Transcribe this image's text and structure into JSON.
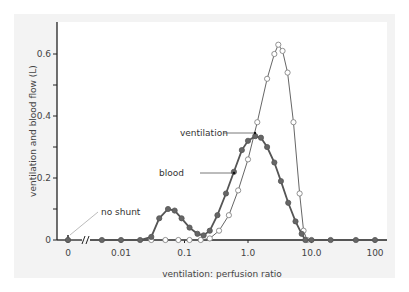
{
  "chart_data": {
    "type": "line",
    "title": "",
    "xlabel": "ventilation: perfusion ratio",
    "ylabel": "ventilation and blood flow (L)",
    "x_scale": "log",
    "x_ticks": [
      "0",
      "0.01",
      "0.1",
      "1.0",
      "10.0",
      "100"
    ],
    "y_ticks": [
      "0",
      "0.2",
      "0.4",
      "0.6"
    ],
    "ylim": [
      0,
      0.7
    ],
    "grid": false,
    "legend": "none (inline annotations)",
    "series": [
      {
        "name": "blood",
        "marker": "filled circle",
        "x": [
          0.005,
          0.01,
          0.02,
          0.03,
          0.04,
          0.055,
          0.07,
          0.09,
          0.12,
          0.16,
          0.2,
          0.25,
          0.33,
          0.45,
          0.6,
          0.8,
          1.0,
          1.3,
          1.6,
          2.0,
          2.6,
          3.3,
          4.3,
          5.6,
          7.0,
          8.0,
          10,
          20,
          50,
          100
        ],
        "values": [
          0,
          0,
          0,
          0.01,
          0.07,
          0.1,
          0.095,
          0.07,
          0.04,
          0.02,
          0.015,
          0.03,
          0.08,
          0.15,
          0.22,
          0.29,
          0.32,
          0.335,
          0.33,
          0.3,
          0.25,
          0.19,
          0.12,
          0.06,
          0.02,
          0.0,
          0,
          0,
          0,
          0
        ]
      },
      {
        "name": "ventilation",
        "marker": "open circle",
        "x": [
          0.03,
          0.05,
          0.08,
          0.12,
          0.18,
          0.25,
          0.35,
          0.5,
          0.7,
          1.0,
          1.4,
          2.0,
          2.6,
          3.0,
          3.5,
          4.2,
          5.2,
          6.5,
          7.5,
          8.5
        ],
        "values": [
          0,
          0,
          0,
          0,
          0,
          0.005,
          0.03,
          0.08,
          0.16,
          0.26,
          0.38,
          0.52,
          0.6,
          0.63,
          0.61,
          0.54,
          0.38,
          0.15,
          0.03,
          0.0
        ]
      }
    ],
    "annotations": [
      {
        "text": "ventilation",
        "points_to": "ventilation curve"
      },
      {
        "text": "blood",
        "points_to": "blood curve"
      },
      {
        "text": "no shunt",
        "points_to": "x = 0 point"
      }
    ]
  }
}
